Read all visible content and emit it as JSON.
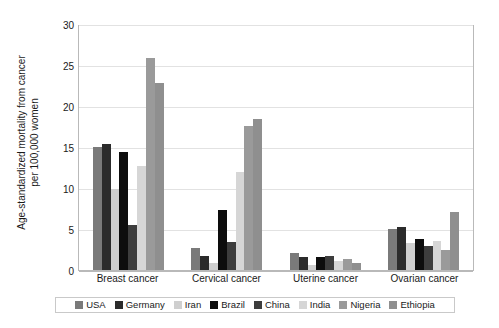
{
  "chart_data": {
    "type": "bar",
    "title": "",
    "xlabel": "",
    "ylabel": "Age-standardized mortality from cancer per 100,000 women",
    "ylabel_line1": "Age-standardized mortality from cancer",
    "ylabel_line2": "per 100,000 women",
    "categories": [
      "Breast cancer",
      "Cervical cancer",
      "Uterine cancer",
      "Ovarian cancer"
    ],
    "ylim": [
      0,
      30
    ],
    "yticks": [
      0,
      5,
      10,
      15,
      20,
      25,
      30
    ],
    "ytick_labels": [
      "0",
      "5",
      "10",
      "15",
      "20",
      "25",
      "30"
    ],
    "grid": true,
    "legend_position": "bottom",
    "series": [
      {
        "name": "USA",
        "color": "#7a7a7a",
        "values": [
          15.0,
          2.7,
          2.1,
          5.0
        ]
      },
      {
        "name": "Germany",
        "color": "#2b2b2b",
        "values": [
          15.4,
          1.7,
          1.6,
          5.2
        ]
      },
      {
        "name": "Iran",
        "color": "#cfcfcf",
        "values": [
          9.9,
          0.9,
          0.6,
          3.3
        ]
      },
      {
        "name": "Brazil",
        "color": "#0d0d0d",
        "values": [
          14.4,
          7.3,
          1.6,
          3.8
        ]
      },
      {
        "name": "China",
        "color": "#3d3d3d",
        "values": [
          5.5,
          3.4,
          1.7,
          2.9
        ]
      },
      {
        "name": "India",
        "color": "#d6d6d6",
        "values": [
          12.7,
          12.0,
          1.1,
          3.5
        ]
      },
      {
        "name": "Nigeria",
        "color": "#9a9a9a",
        "values": [
          25.8,
          17.6,
          1.4,
          2.4
        ]
      },
      {
        "name": "Ethiopia",
        "color": "#8f8f8f",
        "values": [
          22.8,
          18.4,
          0.8,
          7.1
        ]
      }
    ]
  }
}
